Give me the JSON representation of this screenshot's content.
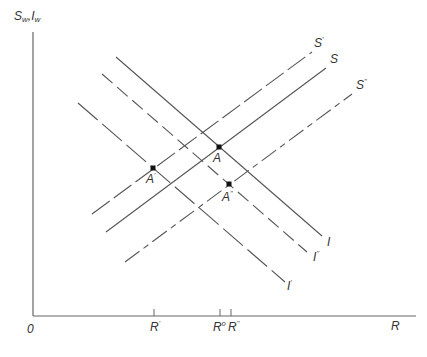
{
  "axes": {
    "y_label": "S",
    "y_label_sub1": "w",
    "y_label_sep": ",",
    "y_label_2": "I",
    "y_label_sub2": "w",
    "x_label": "R",
    "origin": "0"
  },
  "ticks": [
    {
      "label": "R",
      "sup": "'",
      "x": 154
    },
    {
      "label": "R",
      "sup": "o",
      "x": 220
    },
    {
      "label": "R",
      "sup": "''",
      "x": 231
    }
  ],
  "curves": {
    "S_prime": {
      "label": "S",
      "sup": "'",
      "style": "dashed",
      "from": [
        92,
        214
      ],
      "to": [
        312,
        52
      ]
    },
    "S": {
      "label": "S",
      "sup": "",
      "style": "solid",
      "from": [
        106,
        232
      ],
      "to": [
        326,
        68
      ]
    },
    "S_dprime": {
      "label": "S",
      "sup": "''",
      "style": "dash-dot",
      "from": [
        125,
        262
      ],
      "to": [
        352,
        94
      ]
    },
    "I": {
      "label": "I",
      "sup": "",
      "style": "solid",
      "from": [
        116,
        57
      ],
      "to": [
        322,
        236
      ]
    },
    "I_dprime": {
      "label": "I",
      "sup": "''",
      "style": "dashed",
      "from": [
        102,
        74
      ],
      "to": [
        307,
        252
      ]
    },
    "I_prime": {
      "label": "I",
      "sup": "'",
      "style": "long-dash",
      "from": [
        78,
        103
      ],
      "to": [
        285,
        282
      ]
    }
  },
  "points": [
    {
      "label": "A",
      "sup": "'",
      "x": 153,
      "y": 168
    },
    {
      "label": "A",
      "sup": "",
      "x": 219,
      "y": 147
    },
    {
      "label": "A",
      "sup": "''",
      "x": 229,
      "y": 184
    }
  ],
  "colors": {
    "line": "#555555",
    "axis": "#666666",
    "text": "#333333"
  }
}
